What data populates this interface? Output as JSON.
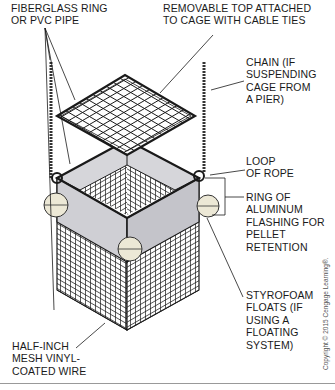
{
  "figure": {
    "labels": {
      "fiberglass_ring": "FIBERGLASS RING\nOR PVC PIPE",
      "removable_top": "REMOVABLE TOP ATTACHED\nTO CAGE WITH CABLE TIES",
      "chain": "CHAIN (IF\nSUSPENDING\nCAGE FROM\nA PIER)",
      "loop_of_rope": "LOOP\nOF ROPE",
      "aluminum_ring": "RING OF\nALUMINUM\nFLASHING FOR\nPELLET\nRETENTION",
      "styrofoam_floats": "STYROFOAM\nFLOATS (IF\nUSING A\nFLOATING\nSYSTEM)",
      "mesh_wire": "HALF-INCH\nMESH VINYL-\nCOATED WIRE"
    },
    "copyright": "Copyright © 2015 Cengage Learning®.",
    "colors": {
      "line": "#1a1a1a",
      "flashing": "#cfcfd4",
      "float": "#ece8d6",
      "background": "#ffffff"
    }
  }
}
